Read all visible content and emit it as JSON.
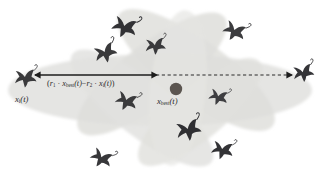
{
  "figure": {
    "kind": "mrfo-cyclone-foraging-diagram",
    "width": 323,
    "height": 181,
    "background": "#ffffff"
  },
  "labels": {
    "formula": {
      "text": "(r₁ · x_best(t) − r₂ · x_i(t))",
      "parts": {
        "open": "(",
        "r1": "r",
        "r1_sub": "1",
        "dot1": "·",
        "xbest": "x",
        "xbest_sub": "best",
        "t1": "(t)",
        "minus": "−",
        "r2": "r",
        "r2_sub": "2",
        "dot2": "·",
        "xi": "x",
        "xi_sub": "i",
        "t2": "(t)",
        "close": ")"
      }
    },
    "x_i": {
      "text": "x_i(t)",
      "parts": {
        "sym": "x",
        "sub": "i",
        "arg": "(t)"
      }
    },
    "x_best": {
      "text": "x_best(t)",
      "parts": {
        "sym": "x",
        "sub": "best",
        "arg": "(t)"
      }
    }
  },
  "colors": {
    "petal_light": "#e9e9e7",
    "petal_mid": "#dededb",
    "petal_dark": "#d2d2cf",
    "ray_body": "#3a3a3c",
    "ray_body_light": "#4d4d50",
    "best_dot": "#5b5550",
    "arrow_solid": "#1c1c1c",
    "arrow_dashed": "#2a2a2a",
    "text": "#2b2b2b"
  },
  "best_position": {
    "cx": 176,
    "cy": 89,
    "r": 6.2
  },
  "arrow": {
    "y": 75,
    "solid": {
      "x1": 35,
      "x2": 156
    },
    "dashed": {
      "x1": 156,
      "x2": 292
    },
    "head_x": 293,
    "dash_pattern": "3.2 2.6"
  },
  "petals": [
    {
      "name": "petal-horizontal-main",
      "cx": 160,
      "cy": 90,
      "rx": 152,
      "ry": 36,
      "rot": 0,
      "fill": "#e4e4e1",
      "opacity": 0.95
    },
    {
      "name": "petal-upper-left",
      "cx": 152,
      "cy": 74,
      "rx": 92,
      "ry": 30,
      "rot": -38,
      "fill": "#dededb",
      "opacity": 0.85
    },
    {
      "name": "petal-upper-right",
      "cx": 196,
      "cy": 70,
      "rx": 95,
      "ry": 30,
      "rot": 36,
      "fill": "#dededb",
      "opacity": 0.82
    },
    {
      "name": "petal-lower-left",
      "cx": 142,
      "cy": 108,
      "rx": 88,
      "ry": 28,
      "rot": 38,
      "fill": "#e2e2df",
      "opacity": 0.85
    },
    {
      "name": "petal-lower-right",
      "cx": 200,
      "cy": 112,
      "rx": 78,
      "ry": 26,
      "rot": -40,
      "fill": "#e0e0dd",
      "opacity": 0.82
    },
    {
      "name": "petal-vertical",
      "cx": 178,
      "cy": 88,
      "rx": 28,
      "ry": 78,
      "rot": 6,
      "fill": "#e6e6e3",
      "opacity": 0.7
    }
  ],
  "manta_rays": [
    {
      "name": "manta-ray-left-anchor",
      "cx": 25,
      "cy": 78,
      "scale": 0.92,
      "rot": -6,
      "shade": "#3a3a3c"
    },
    {
      "name": "manta-ray-top-1",
      "cx": 124,
      "cy": 27,
      "scale": 1.05,
      "rot": 14,
      "shade": "#323235"
    },
    {
      "name": "manta-ray-top-2",
      "cx": 155,
      "cy": 46,
      "scale": 0.86,
      "rot": -8,
      "shade": "#3a3a3c"
    },
    {
      "name": "manta-ray-upper-left",
      "cx": 105,
      "cy": 53,
      "scale": 0.95,
      "rot": -22,
      "shade": "#39393b"
    },
    {
      "name": "manta-ray-top-right",
      "cx": 234,
      "cy": 31,
      "scale": 0.95,
      "rot": 20,
      "shade": "#3c3c3e"
    },
    {
      "name": "manta-ray-right-edge",
      "cx": 303,
      "cy": 73,
      "scale": 0.88,
      "rot": -14,
      "shade": "#353538"
    },
    {
      "name": "manta-ray-mid-right",
      "cx": 218,
      "cy": 97,
      "scale": 0.8,
      "rot": 12,
      "shade": "#3e3e41"
    },
    {
      "name": "manta-ray-mid-left",
      "cx": 126,
      "cy": 101,
      "scale": 0.92,
      "rot": 16,
      "shade": "#3a3a3c"
    },
    {
      "name": "manta-ray-bottom-mid",
      "cx": 188,
      "cy": 130,
      "scale": 1.05,
      "rot": -16,
      "shade": "#2f2f32"
    },
    {
      "name": "manta-ray-bottom-right",
      "cx": 222,
      "cy": 150,
      "scale": 0.92,
      "rot": 8,
      "shade": "#333336"
    },
    {
      "name": "manta-ray-bottom-left",
      "cx": 101,
      "cy": 158,
      "scale": 0.92,
      "rot": 22,
      "shade": "#37373a"
    }
  ]
}
